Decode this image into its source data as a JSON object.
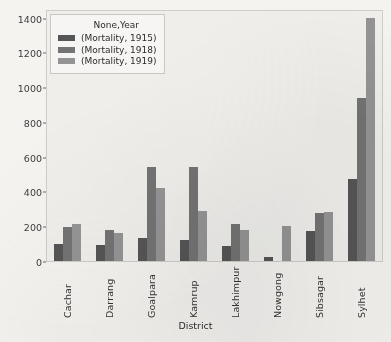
{
  "chart_data": {
    "type": "bar",
    "title": "",
    "xlabel": "District",
    "ylabel": "",
    "ylim": [
      0,
      1450
    ],
    "grid": false,
    "legend_position": "upper-left",
    "legend_title": "None,Year",
    "categories": [
      "Cachar",
      "Darrang",
      "Goalpara",
      "Kamrup",
      "Lakhimpur",
      "Nowgong",
      "Sibsagar",
      "Sylhet"
    ],
    "yticks": [
      0,
      200,
      400,
      600,
      800,
      1000,
      1200,
      1400
    ],
    "ytick_labels": [
      "0",
      "200",
      "400",
      "600",
      "800",
      "1000",
      "1200",
      "1400"
    ],
    "series": [
      {
        "name": "(Mortality, 1915)",
        "color": "#555555",
        "values": [
          100,
          95,
          130,
          120,
          85,
          25,
          170,
          470
        ]
      },
      {
        "name": "(Mortality, 1918)",
        "color": "#737373",
        "values": [
          195,
          180,
          540,
          540,
          215,
          0,
          275,
          940
        ]
      },
      {
        "name": "(Mortality, 1919)",
        "color": "#949494",
        "values": [
          215,
          160,
          420,
          285,
          180,
          200,
          280,
          1400
        ]
      }
    ]
  }
}
